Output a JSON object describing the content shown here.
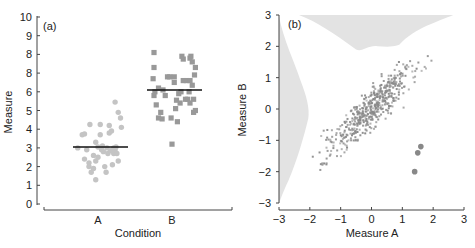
{
  "chart_data": [
    {
      "type": "scatter",
      "panel_label": "(a)",
      "title": "",
      "xlabel": "Condition",
      "ylabel": "Measure",
      "categories": [
        "A",
        "B"
      ],
      "yticks": [
        "0",
        "1",
        "2",
        "3",
        "4",
        "5",
        "6",
        "8",
        "8",
        "9",
        "10"
      ],
      "ylim": [
        0,
        10
      ],
      "grid": false,
      "series": [
        {
          "name": "A",
          "marker": "circle",
          "color": "#c4c4c4",
          "mean": 3.05,
          "points": [
            [
              -0.45,
              3.0
            ],
            [
              -0.35,
              3.7
            ],
            [
              -0.3,
              3.75
            ],
            [
              -0.25,
              2.9
            ],
            [
              -0.2,
              2.2
            ],
            [
              -0.2,
              2.0
            ],
            [
              -0.15,
              1.7
            ],
            [
              -0.3,
              2.4
            ],
            [
              -0.1,
              2.6
            ],
            [
              -0.1,
              1.9
            ],
            [
              -0.05,
              1.3
            ],
            [
              -0.05,
              2.3
            ],
            [
              0,
              3.05
            ],
            [
              0,
              2.5
            ],
            [
              0.05,
              3.7
            ],
            [
              0.05,
              4.25
            ],
            [
              0.1,
              3.1
            ],
            [
              0.12,
              2.8
            ],
            [
              0.15,
              2.0
            ],
            [
              0.18,
              1.7
            ],
            [
              0.2,
              3.0
            ],
            [
              0.22,
              2.7
            ],
            [
              0.25,
              4.2
            ],
            [
              0.25,
              3.8
            ],
            [
              0.3,
              3.9
            ],
            [
              0.32,
              2.1
            ],
            [
              0.35,
              3.0
            ],
            [
              0.35,
              2.7
            ],
            [
              0.38,
              2.9
            ],
            [
              0.4,
              3.05
            ],
            [
              0.42,
              2.7
            ],
            [
              0.45,
              4.9
            ],
            [
              0.45,
              2.3
            ],
            [
              0.5,
              4.6
            ],
            [
              0.52,
              4.1
            ],
            [
              0.38,
              5.45
            ],
            [
              -0.18,
              4.25
            ],
            [
              -0.05,
              3.3
            ],
            [
              0.08,
              2.9
            ],
            [
              0.28,
              2.85
            ]
          ]
        },
        {
          "name": "B",
          "marker": "square",
          "color": "#999999",
          "mean": 6.1,
          "points": [
            [
              -0.4,
              8.1
            ],
            [
              -0.4,
              7.3
            ],
            [
              -0.42,
              6.7
            ],
            [
              -0.38,
              6.0
            ],
            [
              -0.4,
              5.8
            ],
            [
              -0.35,
              5.3
            ],
            [
              -0.3,
              4.6
            ],
            [
              -0.25,
              4.9
            ],
            [
              -0.22,
              4.55
            ],
            [
              -0.3,
              6.2
            ],
            [
              -0.2,
              6.1
            ],
            [
              -0.15,
              5.8
            ],
            [
              -0.1,
              6.8
            ],
            [
              -0.05,
              6.8
            ],
            [
              -0.02,
              4.6
            ],
            [
              0.0,
              3.2
            ],
            [
              0.05,
              6.5
            ],
            [
              0.05,
              6.8
            ],
            [
              0.08,
              5.1
            ],
            [
              0.1,
              5.55
            ],
            [
              0.12,
              4.4
            ],
            [
              0.15,
              5.9
            ],
            [
              0.18,
              5.4
            ],
            [
              0.2,
              6.0
            ],
            [
              0.22,
              7.9
            ],
            [
              0.25,
              7.75
            ],
            [
              0.25,
              6.6
            ],
            [
              0.3,
              5.6
            ],
            [
              0.32,
              6.6
            ],
            [
              0.35,
              5.6
            ],
            [
              0.38,
              6.0
            ],
            [
              0.4,
              6.6
            ],
            [
              0.4,
              5.4
            ],
            [
              0.42,
              7.9
            ],
            [
              0.45,
              6.35
            ],
            [
              0.45,
              7.6
            ],
            [
              0.48,
              5.6
            ],
            [
              0.48,
              4.9
            ],
            [
              0.5,
              6.9
            ],
            [
              0.52,
              7.3
            ],
            [
              0.52,
              5.0
            ],
            [
              0.4,
              7.8
            ]
          ]
        }
      ]
    },
    {
      "type": "scatter",
      "panel_label": "(b)",
      "title": "",
      "xlabel": "Measure A",
      "ylabel": "Measure B",
      "xticks": [
        "−3",
        "−2",
        "−1",
        "0",
        "1",
        "2",
        "3"
      ],
      "yticks": [
        "−3",
        "−2",
        "−1",
        "0",
        "1",
        "2",
        "3"
      ],
      "xlim": [
        -3,
        3
      ],
      "ylim": [
        -3,
        3
      ],
      "grid": false,
      "correlation": "strong positive, approx r≈0.85",
      "marginal_density": {
        "top": "grey filled density of Measure A along top edge (peak near x≈0.3)",
        "left": "grey filled density of Measure B along left edge (peak near y≈-0.2)",
        "color": "#e3e3e3"
      },
      "series": [
        {
          "name": "main cloud",
          "marker": "small dot",
          "color": "#8a8a8a",
          "n_approx": 500,
          "center": [
            0,
            0
          ],
          "range_x": [
            -2.3,
            2.7
          ],
          "range_y": [
            -2.8,
            2.6
          ]
        },
        {
          "name": "outliers",
          "marker": "circle",
          "color": "#888888",
          "points": [
            [
              1.6,
              -1.2
            ],
            [
              1.5,
              -1.4
            ],
            [
              1.4,
              -2.0
            ]
          ]
        }
      ]
    }
  ]
}
